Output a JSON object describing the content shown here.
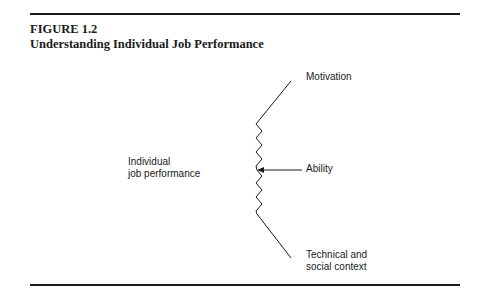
{
  "figure": {
    "label": "FIGURE 1.2",
    "title": "Understanding Individual Job Performance"
  },
  "diagram": {
    "outcome": {
      "line1": "Individual",
      "line2": "job performance"
    },
    "factors": [
      {
        "label": "Motivation"
      },
      {
        "label": "Ability"
      },
      {
        "label_line1": "Technical and",
        "label_line2": "social context"
      }
    ]
  }
}
